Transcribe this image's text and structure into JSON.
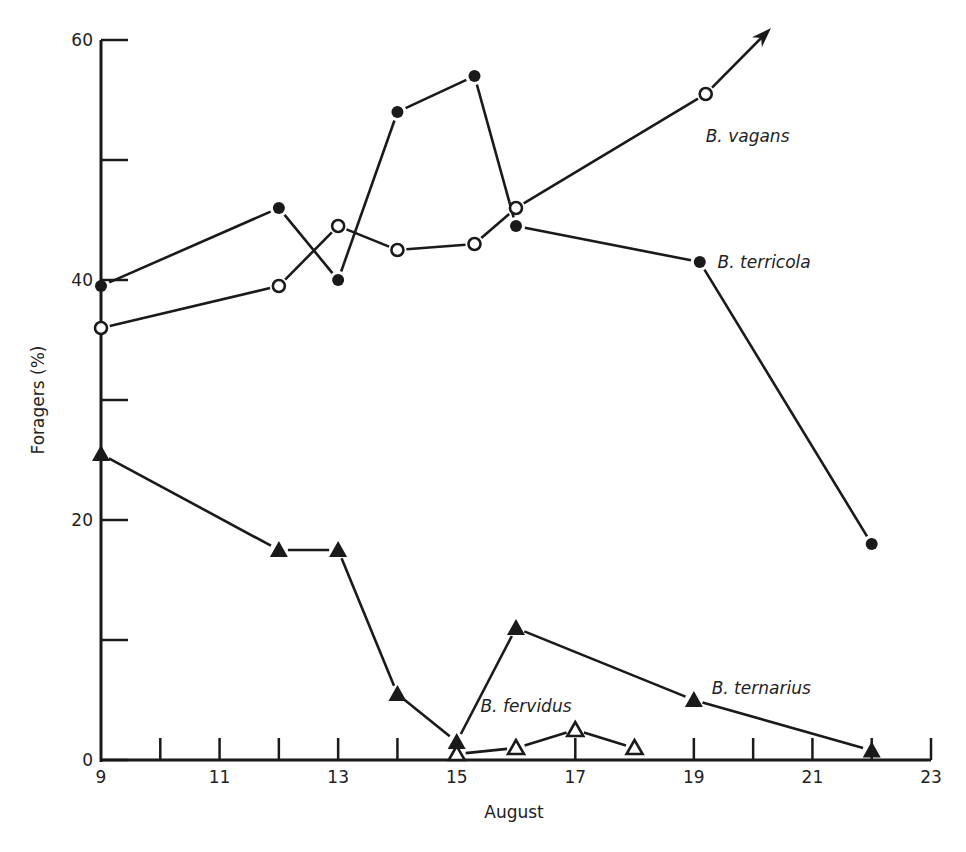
{
  "chart_data": {
    "type": "line",
    "title": "",
    "xlabel": "August",
    "ylabel": "Foragers (%)",
    "xlim": [
      9,
      23
    ],
    "ylim": [
      0,
      60
    ],
    "x_ticks": [
      9,
      11,
      13,
      15,
      17,
      19,
      21,
      23
    ],
    "x_minor_ticks": [
      10,
      12,
      14,
      16,
      18,
      20,
      22
    ],
    "y_ticks": [
      0,
      20,
      40,
      60
    ],
    "y_minor_ticks": [
      10,
      30,
      50
    ],
    "grid": false,
    "legend": "inline labels next to series",
    "series": [
      {
        "name": "B. vagans",
        "marker": "open-circle",
        "x": [
          9,
          12,
          13,
          14,
          15.3,
          16,
          19.2
        ],
        "y": [
          36,
          39.5,
          44.5,
          42.5,
          43,
          46,
          55.5
        ],
        "continues_beyond": "arrow up-right after last point",
        "label_pos": [
          19.2,
          52
        ]
      },
      {
        "name": "B. terricola",
        "marker": "filled-circle",
        "x": [
          9,
          12,
          13,
          14,
          15.3,
          16,
          19.1,
          22
        ],
        "y": [
          39.5,
          46,
          40,
          54,
          57,
          44.5,
          41.5,
          18
        ],
        "label_pos": [
          19.4,
          41.5
        ]
      },
      {
        "name": "B. ternarius",
        "marker": "filled-triangle",
        "x": [
          9,
          12,
          13,
          14,
          15,
          16,
          19,
          22
        ],
        "y": [
          25.5,
          17.5,
          17.5,
          5.5,
          1.5,
          11,
          5,
          0.8
        ],
        "label_pos": [
          19.3,
          6
        ]
      },
      {
        "name": "B. fervidus",
        "marker": "open-triangle",
        "x": [
          15,
          16,
          17,
          18
        ],
        "y": [
          0.5,
          1,
          2.5,
          1
        ],
        "label_pos": [
          15.4,
          4.5
        ]
      }
    ]
  }
}
